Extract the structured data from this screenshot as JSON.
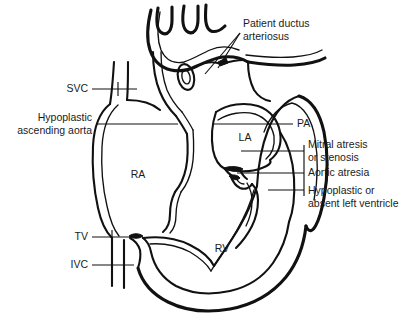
{
  "figure": {
    "type": "anatomical-line-diagram",
    "background_color": "#ffffff",
    "line_color": "#111111",
    "text_color": "#1b1b1b"
  },
  "chamber_labels": [
    {
      "id": "ra",
      "text": "RA",
      "x": 138,
      "y": 178
    },
    {
      "id": "la",
      "text": "LA",
      "x": 245,
      "y": 141
    },
    {
      "id": "rv",
      "text": "RV",
      "x": 222,
      "y": 252
    }
  ],
  "callouts": [
    {
      "id": "patent-ductus-arteriosus",
      "lines": [
        "Patient ductus",
        "arteriosus"
      ],
      "align": "start",
      "x": 243,
      "y": 27
    },
    {
      "id": "svc",
      "lines": [
        "SVC"
      ],
      "align": "end",
      "x": 88,
      "y": 92
    },
    {
      "id": "hypoplastic-ascending-aorta",
      "lines": [
        "Hypoplastic",
        "ascending aorta"
      ],
      "align": "end",
      "x": 92,
      "y": 121
    },
    {
      "id": "tv",
      "lines": [
        "TV"
      ],
      "align": "end",
      "x": 88,
      "y": 240
    },
    {
      "id": "ivc",
      "lines": [
        "IVC"
      ],
      "align": "end",
      "x": 88,
      "y": 268
    },
    {
      "id": "pa",
      "lines": [
        "PA"
      ],
      "align": "start",
      "x": 297,
      "y": 127
    },
    {
      "id": "mitral-atresia-or-stenosis",
      "lines": [
        "Mitral atresis",
        "or stenosis"
      ],
      "align": "start",
      "x": 308,
      "y": 148
    },
    {
      "id": "aortic-atresia",
      "lines": [
        "Aortic atresia"
      ],
      "align": "start",
      "x": 308,
      "y": 176
    },
    {
      "id": "hypoplastic-or-absent-left-ventricle",
      "lines": [
        "Hypoplastic or",
        "absent left ventricle"
      ],
      "align": "start",
      "x": 308,
      "y": 193
    }
  ]
}
